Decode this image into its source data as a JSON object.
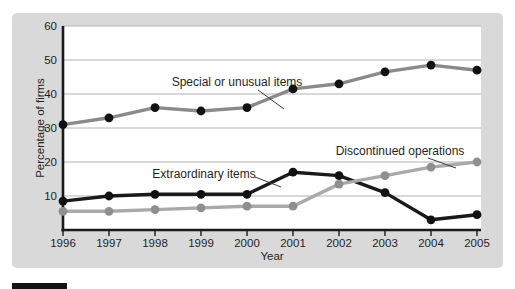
{
  "figure": {
    "bg_color": "#d9d9d9",
    "plot_bg": "#ffffff",
    "grid_color": "#b3b3b3",
    "axis_color": "#1a1a1a",
    "text_color": "#1f1f1f",
    "caption_bar_color": "#121212"
  },
  "chart_data": {
    "type": "line",
    "x": [
      1996,
      1997,
      1998,
      1999,
      2000,
      2001,
      2002,
      2003,
      2004,
      2005
    ],
    "xlabel": "Year",
    "ylabel": "Percentage of firms",
    "ylim": [
      0,
      60
    ],
    "yticks": [
      10,
      20,
      30,
      40,
      50,
      60
    ],
    "grid": "horizontal",
    "legend_position": "inline-annotations",
    "series": [
      {
        "name": "Special or unusual items",
        "values": [
          31,
          33,
          36,
          35,
          36,
          41.5,
          43,
          46.5,
          48.5,
          47
        ],
        "line_color": "#8a8a8a",
        "marker_color": "#111111"
      },
      {
        "name": "Extraordinary items",
        "values": [
          8.5,
          10,
          10.5,
          10.5,
          10.5,
          17,
          16,
          11,
          3,
          4.5
        ],
        "line_color": "#1a1a1a",
        "marker_color": "#111111"
      },
      {
        "name": "Discontinued operations",
        "values": [
          5.5,
          5.5,
          6,
          6.5,
          7,
          7,
          13.5,
          16,
          18.5,
          20
        ],
        "line_color": "#a9a9a9",
        "marker_color": "#8f8f8f"
      }
    ],
    "annotations": [
      {
        "text": "Special or unusual items",
        "tx": 237,
        "ty": 86,
        "leader": [
          258,
          90,
          284,
          109
        ]
      },
      {
        "text": "Extraordinary items",
        "tx": 204,
        "ty": 178,
        "leader": [
          255,
          177,
          281,
          187
        ]
      },
      {
        "text": "Discontinued operations",
        "tx": 400,
        "ty": 155,
        "leader": [
          428,
          158,
          456,
          168
        ]
      }
    ]
  }
}
